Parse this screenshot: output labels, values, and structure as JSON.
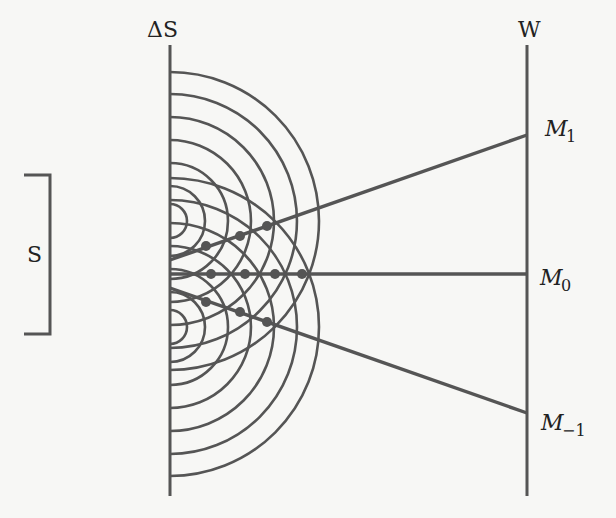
{
  "diagram": {
    "title": "",
    "colors": {
      "stroke": "#555555",
      "background": "#f7f7f5",
      "text": "#222222"
    },
    "labels": {
      "slits": "ΔS",
      "screen": "W",
      "source": "S",
      "m1_main": "M",
      "m1_sub": "1",
      "m0_main": "M",
      "m0_sub": "0",
      "mneg1_main": "M",
      "mneg1_sub": "−1"
    },
    "geometry": {
      "barrier": {
        "x": 170,
        "y1": 45,
        "y2": 496
      },
      "screen": {
        "x": 527,
        "y1": 45,
        "y2": 496
      },
      "source_bracket": {
        "x": 50,
        "y1": 175,
        "y2": 334,
        "tick": 26
      },
      "slit_upper_center": [
        170,
        221
      ],
      "slit_lower_center": [
        170,
        327
      ],
      "radii": [
        17,
        35,
        58,
        81,
        104,
        127,
        149
      ],
      "rays": [
        {
          "name": "ray-m1",
          "from": [
            170,
            260
          ],
          "to": [
            527,
            135
          ]
        },
        {
          "name": "ray-m0",
          "from": [
            170,
            274
          ],
          "to": [
            527,
            274
          ]
        },
        {
          "name": "ray-m-1",
          "from": [
            170,
            288
          ],
          "to": [
            527,
            413
          ]
        }
      ],
      "nodes": [
        [
          206,
          246
        ],
        [
          240,
          236
        ],
        [
          267,
          226
        ],
        [
          211,
          274
        ],
        [
          245,
          274
        ],
        [
          275,
          274
        ],
        [
          302,
          274
        ],
        [
          206,
          302
        ],
        [
          240,
          312
        ],
        [
          267,
          322
        ]
      ]
    }
  }
}
